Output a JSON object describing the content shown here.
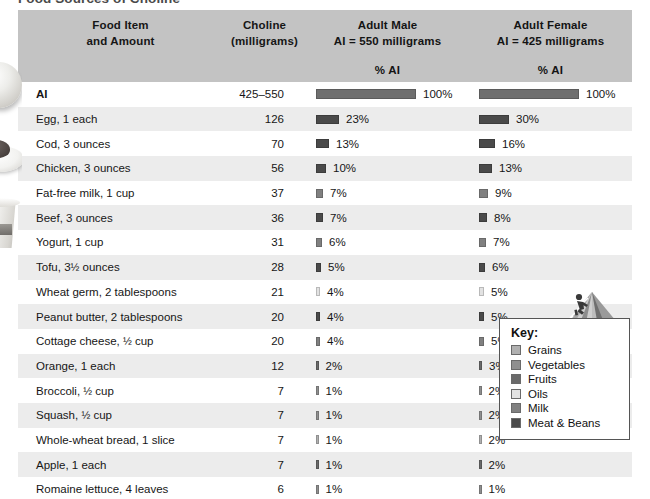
{
  "title": "Food Sources of Choline",
  "columns": {
    "food": {
      "line1": "Food Item",
      "line2": "and Amount"
    },
    "choline": {
      "line1": "Choline",
      "line2": "(milligrams)"
    },
    "male": {
      "line1": "Adult Male",
      "line2": "AI = 550 milligrams",
      "subheader": "% AI"
    },
    "female": {
      "line1": "Adult Female",
      "line2": "AI = 425 milligrams",
      "subheader": "% AI"
    }
  },
  "ai_row": {
    "food": "AI",
    "choline": "425–550",
    "male_pct": "100%",
    "female_pct": "100%",
    "male_value": 100,
    "female_value": 100,
    "color": "#6f6f6f"
  },
  "key": {
    "title": "Key:",
    "items": [
      {
        "label": "Grains",
        "color": "#b0b0b0"
      },
      {
        "label": "Vegetables",
        "color": "#8f8f8f"
      },
      {
        "label": "Fruits",
        "color": "#6a6a6a"
      },
      {
        "label": "Oils",
        "color": "#e2e2e2"
      },
      {
        "label": "Milk",
        "color": "#808080"
      },
      {
        "label": "Meat & Beans",
        "color": "#4a4a4a"
      }
    ]
  },
  "icons": {
    "pyramid": "mypyramid-icon",
    "climber": "person-climbing-icon"
  },
  "chart_data": {
    "type": "bar",
    "title": "Food Sources of Choline",
    "xlabel": "% AI",
    "ylabel": "Food Item and Amount",
    "categories": [
      "AI",
      "Egg, 1 each",
      "Cod, 3 ounces",
      "Chicken, 3 ounces",
      "Fat-free milk, 1 cup",
      "Beef, 3 ounces",
      "Yogurt, 1 cup",
      "Tofu, 3½ ounces",
      "Wheat germ, 2 tablespoons",
      "Peanut butter, 2 tablespoons",
      "Cottage cheese, ½ cup",
      "Orange, 1 each",
      "Broccoli, ½ cup",
      "Squash, ½ cup",
      "Whole-wheat bread, 1 slice",
      "Apple, 1 each",
      "Romaine lettuce, 4 leaves"
    ],
    "choline_mg": [
      "425–550",
      126,
      70,
      56,
      37,
      36,
      31,
      28,
      21,
      20,
      20,
      12,
      7,
      7,
      7,
      7,
      6
    ],
    "series": [
      {
        "name": "Adult Male (AI = 550 mg)",
        "values": [
          100,
          23,
          13,
          10,
          7,
          7,
          6,
          5,
          4,
          4,
          4,
          2,
          1,
          1,
          1,
          1,
          1
        ]
      },
      {
        "name": "Adult Female (AI = 425 mg)",
        "values": [
          100,
          30,
          16,
          13,
          9,
          8,
          7,
          6,
          5,
          5,
          5,
          3,
          2,
          2,
          2,
          2,
          1
        ]
      }
    ],
    "xlim": [
      0,
      100
    ],
    "grid": false,
    "legend": "bottom-right"
  },
  "rows": [
    {
      "food": "Egg, 1 each",
      "choline": "126",
      "male_pct": "23%",
      "female_pct": "30%",
      "male_value": 23,
      "female_value": 30,
      "color": "#4a4a4a"
    },
    {
      "food": "Cod, 3 ounces",
      "choline": "70",
      "male_pct": "13%",
      "female_pct": "16%",
      "male_value": 13,
      "female_value": 16,
      "color": "#4a4a4a"
    },
    {
      "food": "Chicken, 3 ounces",
      "choline": "56",
      "male_pct": "10%",
      "female_pct": "13%",
      "male_value": 10,
      "female_value": 13,
      "color": "#4a4a4a"
    },
    {
      "food": "Fat-free milk, 1 cup",
      "choline": "37",
      "male_pct": "7%",
      "female_pct": "9%",
      "male_value": 7,
      "female_value": 9,
      "color": "#808080"
    },
    {
      "food": "Beef, 3 ounces",
      "choline": "36",
      "male_pct": "7%",
      "female_pct": "8%",
      "male_value": 7,
      "female_value": 8,
      "color": "#4a4a4a"
    },
    {
      "food": "Yogurt, 1 cup",
      "choline": "31",
      "male_pct": "6%",
      "female_pct": "7%",
      "male_value": 6,
      "female_value": 7,
      "color": "#808080"
    },
    {
      "food": "Tofu, 3½ ounces",
      "choline": "28",
      "male_pct": "5%",
      "female_pct": "6%",
      "male_value": 5,
      "female_value": 6,
      "color": "#4a4a4a"
    },
    {
      "food": "Wheat germ, 2 tablespoons",
      "choline": "21",
      "male_pct": "4%",
      "female_pct": "5%",
      "male_value": 4,
      "female_value": 5,
      "color": "#e2e2e2"
    },
    {
      "food": "Peanut butter, 2 tablespoons",
      "choline": "20",
      "male_pct": "4%",
      "female_pct": "5%",
      "male_value": 4,
      "female_value": 5,
      "color": "#4a4a4a"
    },
    {
      "food": "Cottage cheese, ½ cup",
      "choline": "20",
      "male_pct": "4%",
      "female_pct": "5%",
      "male_value": 4,
      "female_value": 5,
      "color": "#808080"
    },
    {
      "food": "Orange, 1 each",
      "choline": "12",
      "male_pct": "2%",
      "female_pct": "3%",
      "male_value": 2,
      "female_value": 3,
      "color": "#6a6a6a"
    },
    {
      "food": "Broccoli, ½ cup",
      "choline": "7",
      "male_pct": "1%",
      "female_pct": "2%",
      "male_value": 1,
      "female_value": 2,
      "color": "#8f8f8f"
    },
    {
      "food": "Squash, ½ cup",
      "choline": "7",
      "male_pct": "1%",
      "female_pct": "2%",
      "male_value": 1,
      "female_value": 2,
      "color": "#8f8f8f"
    },
    {
      "food": "Whole-wheat bread, 1 slice",
      "choline": "7",
      "male_pct": "1%",
      "female_pct": "2%",
      "male_value": 1,
      "female_value": 2,
      "color": "#b0b0b0"
    },
    {
      "food": "Apple, 1 each",
      "choline": "7",
      "male_pct": "1%",
      "female_pct": "2%",
      "male_value": 1,
      "female_value": 2,
      "color": "#6a6a6a"
    },
    {
      "food": "Romaine lettuce, 4 leaves",
      "choline": "6",
      "male_pct": "1%",
      "female_pct": "1%",
      "male_value": 1,
      "female_value": 1,
      "color": "#8f8f8f"
    }
  ]
}
